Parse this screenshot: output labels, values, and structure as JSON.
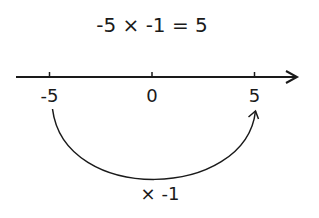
{
  "equation": "-5 × -1 = 5",
  "number_line": {
    "ticks": [
      {
        "value": -5,
        "label": "-5"
      },
      {
        "value": 0,
        "label": "0"
      },
      {
        "value": 5,
        "label": "5"
      }
    ]
  },
  "jump": {
    "from": -5,
    "to": 5,
    "label": "× -1"
  },
  "colors": {
    "ink": "#1a1a1a",
    "background": "#ffffff"
  }
}
